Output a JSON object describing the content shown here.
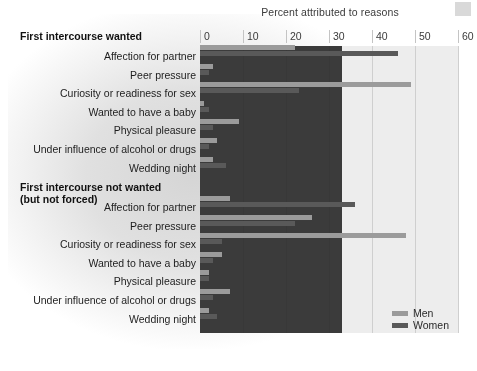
{
  "chart_data": {
    "type": "bar",
    "orientation": "horizontal",
    "title": "",
    "xlabel": "Percent attributed to reasons",
    "ylabel": "",
    "xlim": [
      0,
      60
    ],
    "xticks": [
      0,
      10,
      20,
      30,
      40,
      50,
      60
    ],
    "grid": true,
    "legend_position": "bottom-right",
    "legend": [
      "Men",
      "Women"
    ],
    "colors": {
      "men": "#9b9b9b",
      "women": "#595959",
      "plot_background": "#ededed"
    },
    "categories": [
      "Affection for partner",
      "Peer pressure",
      "Curiosity or readiness for sex",
      "Wanted to have a baby",
      "Physical pleasure",
      "Under influence of alcohol or drugs",
      "Wedding night"
    ],
    "panels": [
      {
        "label": "First intercourse wanted",
        "series": [
          {
            "name": "Men",
            "values": [
              22,
              3,
              49,
              1,
              9,
              4,
              3
            ]
          },
          {
            "name": "Women",
            "values": [
              46,
              2,
              23,
              2,
              3,
              2,
              6
            ]
          }
        ]
      },
      {
        "label": "First intercourse not wanted (but not forced)",
        "series": [
          {
            "name": "Men",
            "values": [
              7,
              26,
              48,
              5,
              2,
              7,
              2
            ]
          },
          {
            "name": "Women",
            "values": [
              36,
              22,
              5,
              3,
              2,
              3,
              4
            ]
          }
        ]
      }
    ]
  },
  "axis": {
    "title": "Percent attributed to reasons",
    "ticks": [
      "0",
      "10",
      "20",
      "30",
      "40",
      "50",
      "60"
    ]
  },
  "panel1": {
    "heading": "First intercourse wanted"
  },
  "panel2": {
    "heading_line1": "First intercourse not wanted",
    "heading_line2": "(but not forced)"
  },
  "legend": {
    "men": "Men",
    "women": "Women"
  }
}
